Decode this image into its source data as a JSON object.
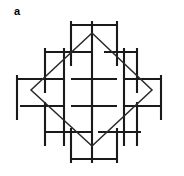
{
  "figure": {
    "label": "a",
    "kind": "line-lattice-diagram",
    "canvas": {
      "width": 184,
      "height": 176
    },
    "colors": {
      "background": "#ffffff",
      "segment_stroke": "#1a1a1a",
      "diamond_stroke": "#2a2a2a",
      "label_color": "#000000"
    },
    "stroke_widths": {
      "segment": 2.1,
      "diamond": 1.5
    },
    "diamond": {
      "vertices": [
        {
          "x": 92,
          "y": 33
        },
        {
          "x": 152,
          "y": 90
        },
        {
          "x": 92,
          "y": 146
        },
        {
          "x": 31,
          "y": 90
        }
      ]
    },
    "horizontal_segments": [
      {
        "x1": 71,
        "y1": 25,
        "x2": 117,
        "y2": 25
      },
      {
        "x1": 45,
        "y1": 52,
        "x2": 92,
        "y2": 52
      },
      {
        "x1": 104,
        "y1": 52,
        "x2": 137,
        "y2": 52
      },
      {
        "x1": 17,
        "y1": 79,
        "x2": 64,
        "y2": 79
      },
      {
        "x1": 71,
        "y1": 79,
        "x2": 117,
        "y2": 79
      },
      {
        "x1": 124,
        "y1": 79,
        "x2": 161,
        "y2": 79
      },
      {
        "x1": 20,
        "y1": 106,
        "x2": 64,
        "y2": 106
      },
      {
        "x1": 71,
        "y1": 106,
        "x2": 117,
        "y2": 106
      },
      {
        "x1": 124,
        "y1": 106,
        "x2": 160,
        "y2": 106
      },
      {
        "x1": 45,
        "y1": 132,
        "x2": 92,
        "y2": 132
      },
      {
        "x1": 98,
        "y1": 132,
        "x2": 141,
        "y2": 132
      },
      {
        "x1": 71,
        "y1": 159,
        "x2": 117,
        "y2": 159
      }
    ],
    "vertical_segments": [
      {
        "x1": 71,
        "y1": 21,
        "x2": 71,
        "y2": 66
      },
      {
        "x1": 117,
        "y1": 21,
        "x2": 117,
        "y2": 66
      },
      {
        "x1": 45,
        "y1": 48,
        "x2": 45,
        "y2": 93
      },
      {
        "x1": 92,
        "y1": 21,
        "x2": 92,
        "y2": 120
      },
      {
        "x1": 137,
        "y1": 48,
        "x2": 137,
        "y2": 93
      },
      {
        "x1": 17,
        "y1": 75,
        "x2": 17,
        "y2": 120
      },
      {
        "x1": 64,
        "y1": 48,
        "x2": 64,
        "y2": 146
      },
      {
        "x1": 124,
        "y1": 48,
        "x2": 124,
        "y2": 146
      },
      {
        "x1": 161,
        "y1": 75,
        "x2": 161,
        "y2": 120
      },
      {
        "x1": 45,
        "y1": 102,
        "x2": 45,
        "y2": 146
      },
      {
        "x1": 92,
        "y1": 78,
        "x2": 92,
        "y2": 163
      },
      {
        "x1": 137,
        "y1": 102,
        "x2": 137,
        "y2": 146
      },
      {
        "x1": 71,
        "y1": 128,
        "x2": 71,
        "y2": 163
      },
      {
        "x1": 117,
        "y1": 128,
        "x2": 117,
        "y2": 163
      }
    ]
  }
}
